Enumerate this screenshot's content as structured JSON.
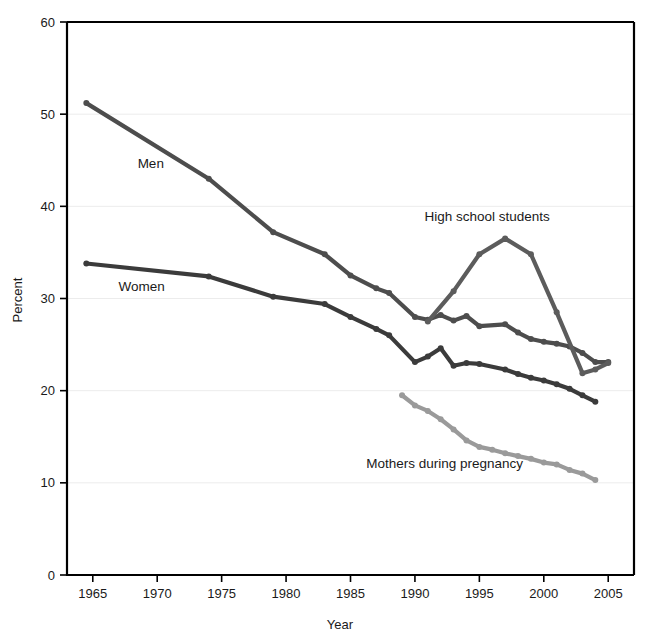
{
  "chart_data": {
    "type": "line",
    "title": "",
    "xlabel": "Year",
    "ylabel": "Percent",
    "xlim": [
      1963,
      2007
    ],
    "ylim": [
      0,
      60
    ],
    "xticks": [
      1965,
      1970,
      1975,
      1980,
      1985,
      1990,
      1995,
      2000,
      2005
    ],
    "yticks": [
      0,
      10,
      20,
      30,
      40,
      50,
      60
    ],
    "grid": "horizontal",
    "legend_position": "inline-annotations",
    "series": [
      {
        "name": "Men",
        "color": "#4d4d4d",
        "label_x": 1969.5,
        "label_y": 44.2,
        "x": [
          1964.5,
          1974,
          1979,
          1983,
          1985,
          1987,
          1988,
          1990,
          1991,
          1992,
          1993,
          1994,
          1995,
          1997,
          1998,
          1999,
          2000,
          2001,
          2002,
          2003,
          2004,
          2005
        ],
        "y": [
          51.2,
          43.0,
          37.2,
          34.8,
          32.5,
          31.1,
          30.6,
          28.0,
          27.7,
          28.2,
          27.6,
          28.1,
          27.0,
          27.2,
          26.3,
          25.6,
          25.3,
          25.1,
          24.8,
          24.1,
          23.1,
          23.1
        ]
      },
      {
        "name": "Women",
        "color": "#3b3b3b",
        "label_x": 1968.8,
        "label_y": 30.8,
        "x": [
          1964.5,
          1974,
          1979,
          1983,
          1985,
          1987,
          1988,
          1990,
          1991,
          1992,
          1993,
          1994,
          1995,
          1997,
          1998,
          1999,
          2000,
          2001,
          2002,
          2003,
          2004
        ],
        "y": [
          33.8,
          32.4,
          30.2,
          29.4,
          28.0,
          26.7,
          26.0,
          23.1,
          23.7,
          24.6,
          22.7,
          23.0,
          22.9,
          22.3,
          21.8,
          21.4,
          21.1,
          20.7,
          20.2,
          19.5,
          18.8
        ]
      },
      {
        "name": "High school students",
        "color": "#5c5c5c",
        "label_x": 1995.6,
        "label_y": 38.4,
        "x": [
          1991,
          1993,
          1995,
          1997,
          1999,
          2001,
          2003,
          2004,
          2005
        ],
        "y": [
          27.5,
          30.8,
          34.8,
          36.5,
          34.8,
          28.5,
          21.9,
          22.3,
          23.0
        ]
      },
      {
        "name": "Mothers during pregnancy",
        "color": "#9a9a9a",
        "label_x": 1992.3,
        "label_y": 11.6,
        "x": [
          1989,
          1990,
          1991,
          1992,
          1993,
          1994,
          1995,
          1996,
          1997,
          1998,
          1999,
          2000,
          2001,
          2002,
          2003,
          2004
        ],
        "y": [
          19.5,
          18.4,
          17.8,
          16.9,
          15.8,
          14.6,
          13.9,
          13.6,
          13.2,
          12.9,
          12.6,
          12.2,
          12.0,
          11.4,
          11.0,
          10.3
        ]
      }
    ]
  },
  "axes": {
    "y_title": "Percent",
    "x_title": "Year",
    "y_tick_labels": [
      "0",
      "10",
      "20",
      "30",
      "40",
      "50",
      "60"
    ],
    "x_tick_labels": [
      "1965",
      "1970",
      "1975",
      "1980",
      "1985",
      "1990",
      "1995",
      "2000",
      "2005"
    ]
  },
  "annotations": {
    "men": "Men",
    "women": "Women",
    "high_school_students": "High school students",
    "mothers_during_pregnancy": "Mothers during pregnancy"
  },
  "colors": {
    "men": "#4d4d4d",
    "women": "#3b3b3b",
    "high_school_students": "#5c5c5c",
    "mothers_during_pregnancy": "#9a9a9a",
    "axis": "#000000",
    "grid": "#ececec",
    "background": "#ffffff"
  }
}
